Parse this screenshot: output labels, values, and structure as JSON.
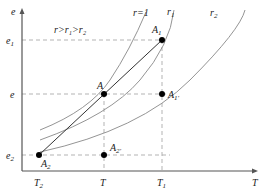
{
  "axes": {
    "y_label": "e",
    "x_label": "T"
  },
  "y_ticks": [
    {
      "label": "e",
      "sub": "1",
      "y": 40
    },
    {
      "label": "e",
      "sub": "",
      "y": 94
    },
    {
      "label": "e",
      "sub": "2",
      "y": 155
    }
  ],
  "x_ticks": [
    {
      "label": "T",
      "sub": "2",
      "x": 39
    },
    {
      "label": "T",
      "sub": "",
      "x": 104
    },
    {
      "label": "T",
      "sub": "1",
      "x": 162
    }
  ],
  "annotation": "r>r₁>r₂",
  "curves": [
    {
      "name": "r=1",
      "label": "r=1"
    },
    {
      "name": "r1",
      "label": "r",
      "sub": "1"
    },
    {
      "name": "r2",
      "label": "r",
      "sub": "2"
    }
  ],
  "points": [
    {
      "id": "A1",
      "label": "A",
      "sub": "1",
      "x": 162,
      "y": 40
    },
    {
      "id": "A",
      "label": "A",
      "sub": "",
      "x": 104,
      "y": 94
    },
    {
      "id": "A1prime",
      "label": "A",
      "sub": "1'",
      "x": 162,
      "y": 94
    },
    {
      "id": "A2",
      "label": "A",
      "sub": "2",
      "x": 39,
      "y": 155
    },
    {
      "id": "A2prime",
      "label": "A",
      "sub": "2'",
      "x": 104,
      "y": 155
    }
  ],
  "colors": {
    "axis": "#555555",
    "curve": "#888888",
    "dash": "#aaaaaa",
    "point": "#000000",
    "line": "#333333"
  }
}
